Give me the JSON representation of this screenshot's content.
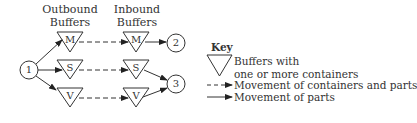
{
  "headers": {
    "outbound": [
      "Outbound",
      "Buffers"
    ],
    "inbound": [
      "Inbound",
      "Buffers"
    ]
  },
  "nodes": [
    {
      "id": "1",
      "label": "1"
    },
    {
      "id": "2",
      "label": "2"
    },
    {
      "id": "3",
      "label": "3"
    }
  ],
  "outbound_buffers": [
    {
      "label": "M"
    },
    {
      "label": "S"
    },
    {
      "label": "V"
    }
  ],
  "inbound_buffers": [
    {
      "label": "M"
    },
    {
      "label": "S"
    },
    {
      "label": "V"
    }
  ],
  "edges": [
    {
      "from": "1",
      "to": "outbound.M",
      "style": "solid"
    },
    {
      "from": "1",
      "to": "outbound.S",
      "style": "solid"
    },
    {
      "from": "1",
      "to": "outbound.V",
      "style": "solid"
    },
    {
      "from": "outbound.M",
      "to": "inbound.M",
      "style": "dashed"
    },
    {
      "from": "outbound.S",
      "to": "inbound.S",
      "style": "dashed"
    },
    {
      "from": "outbound.V",
      "to": "inbound.V",
      "style": "dashed"
    },
    {
      "from": "inbound.M",
      "to": "2",
      "style": "solid"
    },
    {
      "from": "inbound.S",
      "to": "3",
      "style": "solid"
    },
    {
      "from": "inbound.V",
      "to": "3",
      "style": "solid"
    }
  ],
  "key": {
    "title": "Key",
    "buffer_line1": "Buffers with",
    "buffer_line2": "one or more containers",
    "dashed": "Movement of containers and parts",
    "solid": "Movement of parts"
  }
}
